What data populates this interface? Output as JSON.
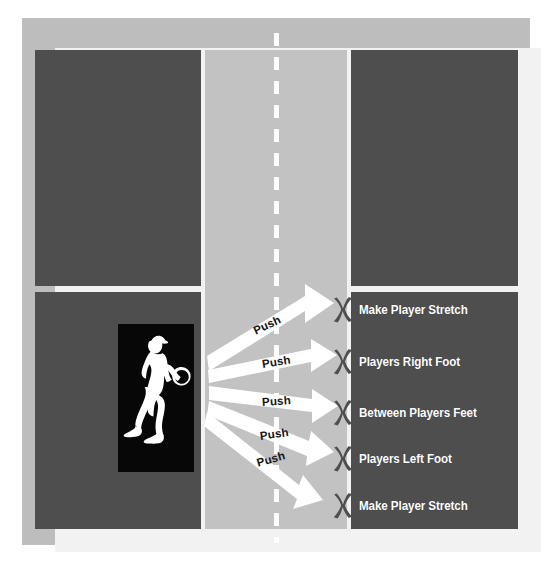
{
  "diagram": {
    "court": {
      "surface_dark_color": "#4e4e4e",
      "surface_mid_color": "#c2c2c2",
      "line_color": "#ffffff",
      "outer_border_color": "#bdbdbd",
      "center_service_line_style": "dashed"
    },
    "player": {
      "icon": "tennis-player-silhouette-icon",
      "box_background": "#070707",
      "silhouette_color": "#ffffff"
    },
    "arrows": [
      {
        "label": "Push",
        "target_index": 0,
        "angle_deg": -24
      },
      {
        "label": "Push",
        "target_index": 1,
        "angle_deg": -12
      },
      {
        "label": "Push",
        "target_index": 2,
        "angle_deg": -1
      },
      {
        "label": "Push",
        "target_index": 3,
        "angle_deg": 10
      },
      {
        "label": "Push",
        "target_index": 4,
        "angle_deg": 21
      }
    ],
    "targets": [
      {
        "marker": "x-mark",
        "label": "Make Player Stretch",
        "marker_color": "#4e4e4e"
      },
      {
        "marker": "x-mark",
        "label": "Players Right Foot",
        "marker_color": "#4e4e4e"
      },
      {
        "marker": "x-mark",
        "label": "Between Players Feet",
        "marker_color": "#4e4e4e"
      },
      {
        "marker": "x-mark",
        "label": "Players Left Foot",
        "marker_color": "#4e4e4e"
      },
      {
        "marker": "x-mark",
        "label": "Make Player Stretch",
        "marker_color": "#4e4e4e"
      }
    ]
  }
}
